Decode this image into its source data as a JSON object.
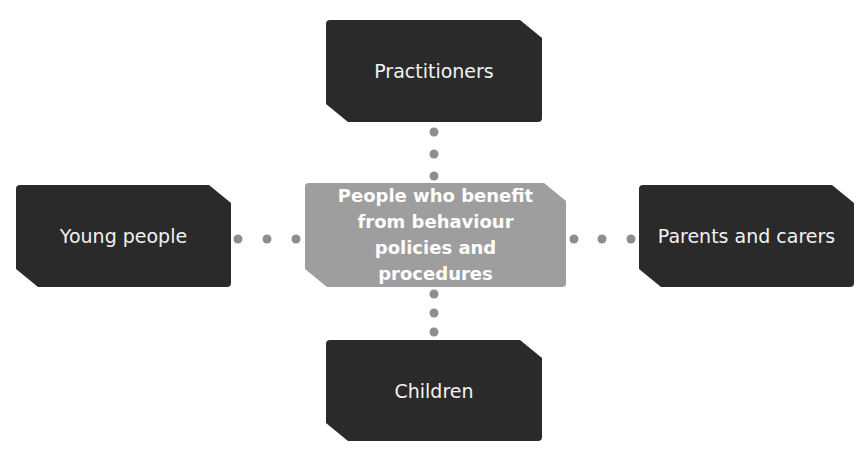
{
  "diagram": {
    "center": {
      "label": "People who benefit from behaviour policies and procedures",
      "color": "#9e9e9e"
    },
    "nodes": [
      {
        "id": "top",
        "label": "Practitioners"
      },
      {
        "id": "left",
        "label": "Young people"
      },
      {
        "id": "right",
        "label": "Parents and carers"
      },
      {
        "id": "bottom",
        "label": "Children"
      }
    ],
    "node_color": "#2a2a2a",
    "connector_color": "#8e8e8e"
  }
}
